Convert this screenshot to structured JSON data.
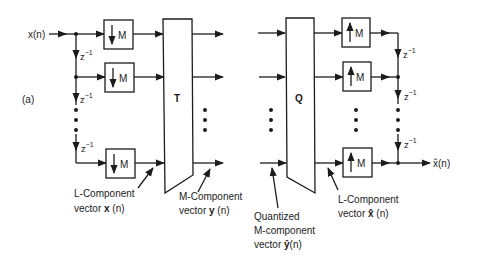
{
  "figure": {
    "panel_label": "(a)",
    "input_signal": "x(n)",
    "output_signal": "x̂(n)",
    "delay_label": "z",
    "delay_exponent": "−1",
    "downsampler_label": "M",
    "upsampler_label": "M",
    "transform_block": "T",
    "quantizer_block": "Q",
    "annotations": {
      "l_component_x": {
        "line1": "L-Component",
        "line2_prefix": "vector ",
        "line2_bold": "x",
        "line2_suffix": " (n)"
      },
      "m_component_y": {
        "line1": "M-Component",
        "line2_prefix": "vector ",
        "line2_bold": "y",
        "line2_suffix": " (n)"
      },
      "quantized_y": {
        "line1": "Quantized",
        "line2": "M-component",
        "line3_prefix": "vector ",
        "line3_bold": "ŷ",
        "line3_suffix": "(n)"
      },
      "l_component_xhat": {
        "line1": "L-Component",
        "line2_prefix": "vector ",
        "line2_bold": "x̂",
        "line2_suffix": " (n)"
      }
    }
  }
}
